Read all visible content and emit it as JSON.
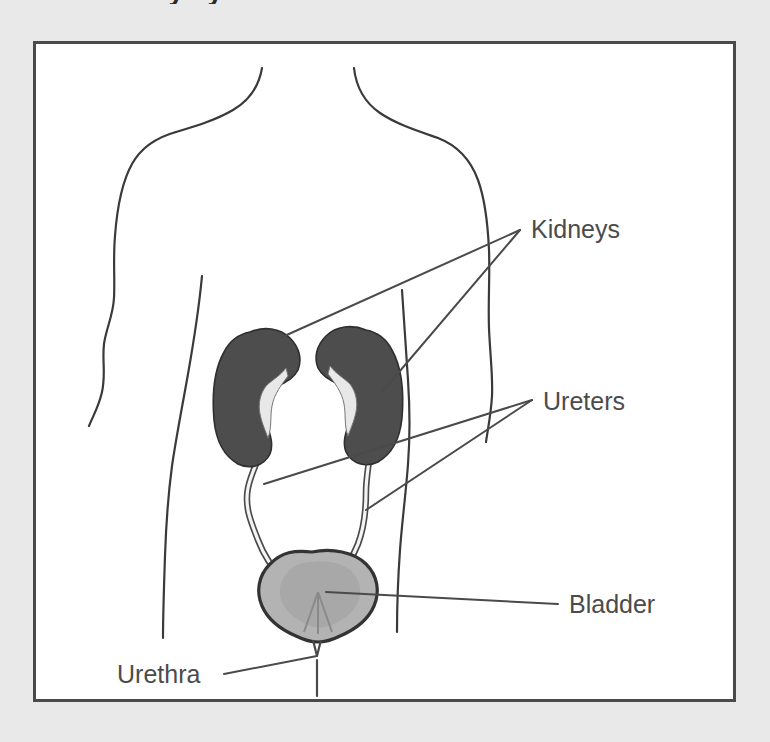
{
  "figure": {
    "title_clipped": "Urinary system",
    "background_color": "#e9e9e9",
    "panel_background": "#ffffff",
    "frame_border_color": "#4a4a4a",
    "labels": [
      {
        "id": "kidneys",
        "text": "Kidneys",
        "x": 528,
        "y": 230
      },
      {
        "id": "ureters",
        "text": "Ureters",
        "x": 540,
        "y": 409
      },
      {
        "id": "bladder",
        "text": "Bladder",
        "x": 568,
        "y": 606
      },
      {
        "id": "urethra",
        "text": "Urethra",
        "x": 114,
        "y": 672
      }
    ],
    "organs": [
      {
        "id": "kidney-left",
        "name": "Kidney (left)",
        "fill": "#4d4d4d",
        "stroke": "#2f2f2f"
      },
      {
        "id": "kidney-right",
        "name": "Kidney (right)",
        "fill": "#4d4d4d",
        "stroke": "#2f2f2f"
      },
      {
        "id": "ureter-left",
        "name": "Ureter (left)",
        "fill": "#f2f2f2",
        "stroke": "#4a4a4a"
      },
      {
        "id": "ureter-right",
        "name": "Ureter (right)",
        "fill": "#f2f2f2",
        "stroke": "#4a4a4a"
      },
      {
        "id": "bladder",
        "name": "Urinary bladder",
        "fill": "#b3b3b3",
        "stroke": "#333333"
      },
      {
        "id": "urethra",
        "name": "Urethra",
        "fill": "none",
        "stroke": "#4a4a4a"
      }
    ],
    "body_outline": {
      "name": "Human torso outline",
      "stroke": "#3a3a3a"
    },
    "leader_lines": {
      "stroke": "#4a4a4a",
      "kidneys_converge": {
        "x": 518,
        "y": 228
      },
      "ureters_converge": {
        "x": 530,
        "y": 397
      },
      "bladder_converge": {
        "x": 556,
        "y": 600
      },
      "urethra_converge": {
        "x": 222,
        "y": 668
      }
    }
  }
}
